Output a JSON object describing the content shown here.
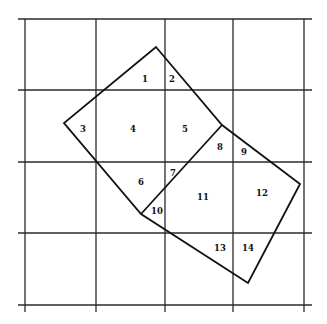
{
  "diagram": {
    "type": "grid-overlay-partition",
    "grid": {
      "vertical_x": [
        25,
        96,
        165,
        233,
        304
      ],
      "horizontal_y": [
        19,
        90,
        162,
        233,
        305
      ],
      "extent": {
        "x0": 18,
        "x1": 312,
        "y0": 19,
        "y1": 305
      }
    },
    "polygon": {
      "vertices": [
        [
          156,
          47
        ],
        [
          222,
          125
        ],
        [
          300,
          184
        ],
        [
          248,
          283
        ],
        [
          141,
          214
        ],
        [
          64,
          123
        ]
      ],
      "inner_edge": [
        [
          222,
          125
        ],
        [
          141,
          214
        ]
      ]
    },
    "labels": [
      {
        "text": "1",
        "x": 145,
        "y": 79
      },
      {
        "text": "2",
        "x": 172,
        "y": 79
      },
      {
        "text": "3",
        "x": 83,
        "y": 129
      },
      {
        "text": "4",
        "x": 133,
        "y": 129
      },
      {
        "text": "5",
        "x": 185,
        "y": 129
      },
      {
        "text": "6",
        "x": 141,
        "y": 182
      },
      {
        "text": "7",
        "x": 173,
        "y": 173
      },
      {
        "text": "8",
        "x": 220,
        "y": 147
      },
      {
        "text": "9",
        "x": 244,
        "y": 152
      },
      {
        "text": "10",
        "x": 157,
        "y": 211
      },
      {
        "text": "11",
        "x": 203,
        "y": 197
      },
      {
        "text": "12",
        "x": 262,
        "y": 193
      },
      {
        "text": "13",
        "x": 220,
        "y": 248
      },
      {
        "text": "14",
        "x": 248,
        "y": 248
      }
    ]
  }
}
